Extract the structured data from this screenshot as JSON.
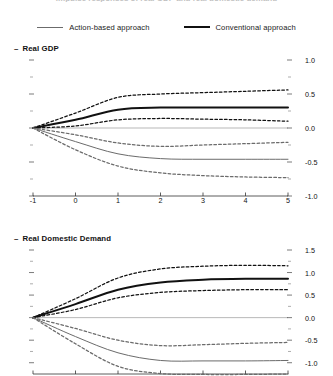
{
  "figure": {
    "cropped_top_title": "Impulse responses of real GDP and real domestic demand",
    "legend": [
      {
        "label": "Action-based approach",
        "style": "thin-solid",
        "color": "#6b6b6b"
      },
      {
        "label": "Conventional approach",
        "style": "thick-solid",
        "color": "#111111"
      }
    ]
  },
  "chart_data": [
    {
      "type": "line",
      "title": "Real GDP",
      "xlabel": "",
      "ylabel": "",
      "x": [
        -1,
        0,
        1,
        2,
        3,
        4,
        5
      ],
      "xlim": [
        -1,
        5
      ],
      "ylim": [
        -1.0,
        1.0
      ],
      "xticks": [
        -1,
        0,
        1,
        2,
        3,
        4,
        5
      ],
      "xticklabels": [
        "-1",
        "0",
        "1",
        "2",
        "3",
        "4",
        "5"
      ],
      "yticks": [
        -1.0,
        -0.5,
        0.0,
        0.5,
        1.0
      ],
      "yticklabels": [
        "-1.0",
        "-0.5",
        "0.0",
        "0.5",
        "1.0"
      ],
      "yminorticks": [
        -0.75,
        -0.25,
        0.25,
        0.75
      ],
      "y_axis_side": "right",
      "grid": false,
      "zero_line": true,
      "legend_position": "top-center-outside",
      "series": [
        {
          "name": "Conventional approach",
          "style": "thick-solid",
          "color": "#111111",
          "values": [
            0.0,
            0.12,
            0.27,
            0.3,
            0.3,
            0.3,
            0.3
          ]
        },
        {
          "name": "Conventional approach upper band",
          "style": "dashed",
          "color": "#111111",
          "values": [
            0.0,
            0.22,
            0.45,
            0.5,
            0.52,
            0.54,
            0.56
          ]
        },
        {
          "name": "Conventional approach lower band",
          "style": "dashed",
          "color": "#111111",
          "values": [
            0.0,
            0.03,
            0.12,
            0.14,
            0.13,
            0.12,
            0.1
          ]
        },
        {
          "name": "Action-based approach",
          "style": "thin-solid",
          "color": "#6b6b6b",
          "values": [
            0.0,
            -0.2,
            -0.38,
            -0.45,
            -0.46,
            -0.46,
            -0.46
          ]
        },
        {
          "name": "Action-based approach upper band",
          "style": "dashed",
          "color": "#6b6b6b",
          "values": [
            0.0,
            -0.1,
            -0.22,
            -0.27,
            -0.25,
            -0.23,
            -0.21
          ]
        },
        {
          "name": "Action-based approach lower band",
          "style": "dashed",
          "color": "#6b6b6b",
          "values": [
            0.0,
            -0.32,
            -0.56,
            -0.66,
            -0.7,
            -0.72,
            -0.73
          ]
        }
      ]
    },
    {
      "type": "line",
      "title": "Real Domestic Demand",
      "xlabel": "",
      "ylabel": "",
      "x": [
        -1,
        0,
        1,
        2,
        3,
        4,
        5
      ],
      "xlim": [
        -1,
        5
      ],
      "ylim": [
        -1.25,
        1.5
      ],
      "xticks": [
        -1,
        0,
        1,
        2,
        3,
        4,
        5
      ],
      "xticklabels": [
        "-1",
        "0",
        "1",
        "2",
        "3",
        "4",
        "5"
      ],
      "yticks": [
        -1.0,
        -0.5,
        0.0,
        0.5,
        1.0,
        1.5
      ],
      "yticklabels": [
        "-1.0",
        "-0.5",
        "0.0",
        "0.5",
        "1.0",
        "1.5"
      ],
      "yminorticks": [
        -0.75,
        -0.25,
        0.25,
        0.75,
        1.25
      ],
      "y_axis_side": "right",
      "grid": false,
      "zero_line": true,
      "legend_position": "shared-top",
      "series": [
        {
          "name": "Conventional approach",
          "style": "thick-solid",
          "color": "#111111",
          "values": [
            0.0,
            0.3,
            0.62,
            0.78,
            0.84,
            0.86,
            0.86
          ]
        },
        {
          "name": "Conventional approach upper band",
          "style": "dashed",
          "color": "#111111",
          "values": [
            0.0,
            0.42,
            0.88,
            1.08,
            1.14,
            1.16,
            1.15
          ]
        },
        {
          "name": "Conventional approach lower band",
          "style": "dashed",
          "color": "#111111",
          "values": [
            0.0,
            0.18,
            0.44,
            0.56,
            0.6,
            0.62,
            0.62
          ]
        },
        {
          "name": "Action-based approach",
          "style": "thin-solid",
          "color": "#6b6b6b",
          "values": [
            0.0,
            -0.42,
            -0.78,
            -0.95,
            -0.96,
            -0.96,
            -0.95
          ]
        },
        {
          "name": "Action-based approach upper band",
          "style": "dashed",
          "color": "#6b6b6b",
          "values": [
            0.0,
            -0.24,
            -0.5,
            -0.62,
            -0.6,
            -0.57,
            -0.55
          ]
        },
        {
          "name": "Action-based approach lower band",
          "style": "dashed",
          "color": "#6b6b6b",
          "values": [
            0.0,
            -0.58,
            -1.08,
            -1.24,
            -1.26,
            -1.26,
            -1.25
          ]
        }
      ]
    }
  ]
}
